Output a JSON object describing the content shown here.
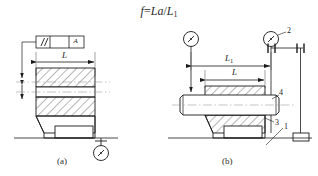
{
  "figure": {
    "formula": {
      "lhs": "f",
      "operator": "=",
      "numerator": "La",
      "slash": "/",
      "denominator": "L",
      "denominator_sub": "1",
      "full_text": "f = La/L1"
    },
    "subfigures": [
      {
        "id": "a",
        "caption": "(a)",
        "tolerance_frame": {
          "symbol": "//",
          "symbol_name": "parallelism-symbol",
          "tolerance_value": "",
          "datum": "A"
        },
        "dimensions": [
          {
            "name": "length-L",
            "label": "L",
            "subscript": ""
          }
        ],
        "instruments": [
          {
            "name": "dial-indicator",
            "label": ""
          }
        ]
      },
      {
        "id": "b",
        "caption": "(b)",
        "dimensions": [
          {
            "name": "length-L1",
            "label": "L",
            "subscript": "1"
          },
          {
            "name": "length-L",
            "label": "L",
            "subscript": ""
          }
        ],
        "callouts": [
          {
            "name": "callout-1",
            "label": "1"
          },
          {
            "name": "callout-2",
            "label": "2"
          },
          {
            "name": "callout-3",
            "label": "3"
          },
          {
            "name": "callout-4",
            "label": "4"
          }
        ],
        "instruments": [
          {
            "name": "dial-indicator-left",
            "label": ""
          },
          {
            "name": "dial-indicator-right",
            "label": "2"
          }
        ]
      }
    ],
    "colors": {
      "line": "#1a1a1a",
      "thin_line": "#444444",
      "hatch": "#333333",
      "background": "#ffffff",
      "centerline": "#777777"
    }
  }
}
